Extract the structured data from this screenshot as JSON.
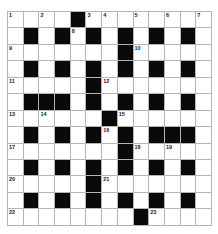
{
  "puzzle": {
    "header_partial": "",
    "rows": 13,
    "cols": 13,
    "grid": [
      "....#........",
      ".#.#.#.#.#.#.",
      ".......#.....",
      ".#.#.#.#.#.#.",
      ".....#.......",
      ".###.#.#.#.#.",
      "......#......",
      ".#.#.#.#.###.",
      ".......#.....",
      ".#.#.#.#.#.#.",
      ".....#.......",
      ".#.#.#.#.#.#.",
      "........#...."
    ],
    "numbers": [
      {
        "r": 0,
        "c": 0,
        "n": "1"
      },
      {
        "r": 0,
        "c": 2,
        "n": "2"
      },
      {
        "r": 0,
        "c": 5,
        "n": "3"
      },
      {
        "r": 0,
        "c": 6,
        "n": "4"
      },
      {
        "r": 0,
        "c": 8,
        "n": "5"
      },
      {
        "r": 0,
        "c": 10,
        "n": "6"
      },
      {
        "r": 0,
        "c": 12,
        "n": "7"
      },
      {
        "r": 1,
        "c": 4,
        "n": "8"
      },
      {
        "r": 2,
        "c": 0,
        "n": "9"
      },
      {
        "r": 2,
        "c": 8,
        "n": "10"
      },
      {
        "r": 4,
        "c": 0,
        "n": "11"
      },
      {
        "r": 4,
        "c": 6,
        "n": "12"
      },
      {
        "r": 6,
        "c": 0,
        "n": "13"
      },
      {
        "r": 6,
        "c": 2,
        "n": "14"
      },
      {
        "r": 6,
        "c": 7,
        "n": "15"
      },
      {
        "r": 7,
        "c": 6,
        "n": "16"
      },
      {
        "r": 8,
        "c": 0,
        "n": "17"
      },
      {
        "r": 8,
        "c": 8,
        "n": "18"
      },
      {
        "r": 8,
        "c": 10,
        "n": "19"
      },
      {
        "r": 10,
        "c": 0,
        "n": "20"
      },
      {
        "r": 10,
        "c": 6,
        "n": "21"
      },
      {
        "r": 12,
        "c": 0,
        "n": "22"
      },
      {
        "r": 12,
        "c": 9,
        "n": "23"
      }
    ],
    "colors": {
      "block": "#0a0a0a",
      "cell": "#ffffff",
      "line": "#b5b5b5"
    }
  }
}
